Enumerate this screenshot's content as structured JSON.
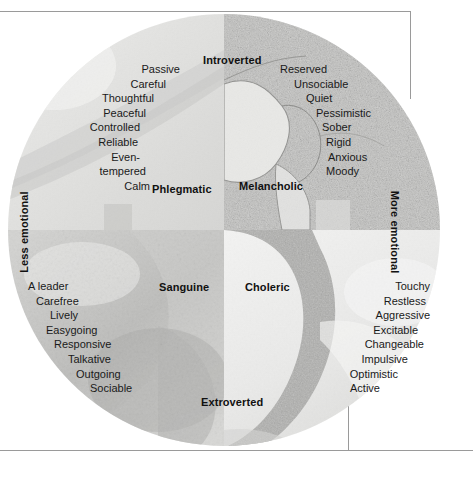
{
  "figure": {
    "axes": {
      "top": "Introverted",
      "bottom": "Extroverted",
      "left": "Less emotional",
      "right": "More emotional"
    }
  },
  "quadrants": [
    {
      "id": "phlegmatic",
      "name": "Phlegmatic",
      "traits": [
        "Passive",
        "Careful",
        "Thoughtful",
        "Peaceful",
        "Controlled",
        "Reliable",
        "Even-",
        "tempered",
        "Calm"
      ]
    },
    {
      "id": "melancholic",
      "name": "Melancholic",
      "traits": [
        "Reserved",
        "Unsociable",
        "Quiet",
        "Pessimistic",
        "Sober",
        "Rigid",
        "Anxious",
        "Moody"
      ]
    },
    {
      "id": "sanguine",
      "name": "Sanguine",
      "traits": [
        "A leader",
        "Carefree",
        "Lively",
        "Easygoing",
        "Responsive",
        "Talkative",
        "Outgoing",
        "Sociable"
      ]
    },
    {
      "id": "choleric",
      "name": "Choleric",
      "traits": [
        "Touchy",
        "Restless",
        "Aggressive",
        "Excitable",
        "Changeable",
        "Impulsive",
        "Optimistic",
        "Active"
      ]
    }
  ],
  "colors": {
    "text": "#1a1a1a",
    "rule": "#9a9a9a",
    "phlegmatic_tint": "#e4e4e2",
    "melancholic_tint": "#b9b9b7",
    "sanguine_tint": "#c9c9c7",
    "choleric_tint": "#efefee"
  }
}
